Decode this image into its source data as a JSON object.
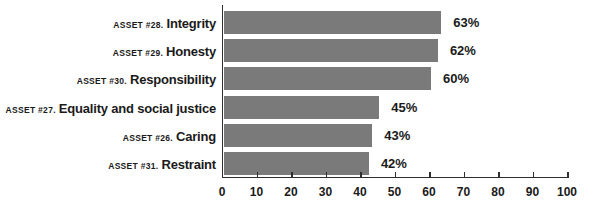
{
  "chart_data": {
    "type": "bar",
    "orientation": "horizontal",
    "categories": [
      {
        "prefix": "ASSET #28.",
        "name": "Integrity"
      },
      {
        "prefix": "ASSET #29.",
        "name": "Honesty"
      },
      {
        "prefix": "ASSET #30.",
        "name": "Responsibility"
      },
      {
        "prefix": "ASSET #27.",
        "name": "Equality and social justice"
      },
      {
        "prefix": "ASSET #26.",
        "name": "Caring"
      },
      {
        "prefix": "ASSET #31.",
        "name": "Restraint"
      }
    ],
    "values": [
      63,
      62,
      60,
      45,
      43,
      42
    ],
    "value_labels": [
      "63%",
      "62%",
      "60%",
      "45%",
      "43%",
      "42%"
    ],
    "xlim": [
      0,
      100
    ],
    "xticks": [
      "0",
      "10",
      "20",
      "30",
      "40",
      "50",
      "60",
      "70",
      "80",
      "90",
      "100"
    ],
    "grid": false,
    "legend": "none",
    "bar_color": "#7a7a7a",
    "axis_color": "#2e2e2e",
    "text_color": "#1a1a1a"
  }
}
